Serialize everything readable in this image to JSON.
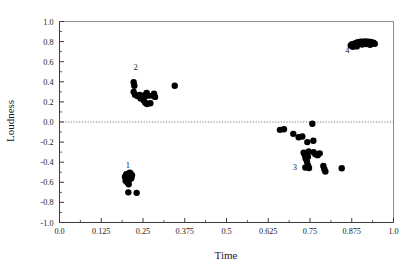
{
  "chart_data": {
    "type": "scatter",
    "title": "",
    "xlabel": "Time",
    "ylabel": "Loudness",
    "xlim": [
      0.0,
      1.0
    ],
    "ylim": [
      -1.0,
      1.0
    ],
    "grid": false,
    "legend": "none",
    "x_ticks": [
      0.0,
      0.125,
      0.25,
      0.375,
      0.5,
      0.625,
      0.75,
      0.875,
      1.0
    ],
    "x_tick_labels": [
      "0.0",
      "0.125",
      "0.25",
      "0.375",
      "0.5",
      "0.625",
      "0.75",
      "0.875",
      "1.0"
    ],
    "y_ticks": [
      -1.0,
      -0.8,
      -0.6,
      -0.4,
      -0.2,
      0.0,
      0.2,
      0.4,
      0.6,
      0.8,
      1.0
    ],
    "y_tick_labels": [
      "-1.0",
      "-0.8",
      "-0.6",
      "-0.4",
      "-0.2",
      "0.0",
      "0.2",
      "0.4",
      "0.6",
      "0.8",
      "1.0"
    ],
    "x_minor_ticks": [
      0.0625,
      0.1875,
      0.3125,
      0.4375,
      0.5625,
      0.6875,
      0.8125,
      0.9375
    ],
    "y_minor_ticks": [
      -0.9,
      -0.7,
      -0.5,
      -0.3,
      -0.1,
      0.1,
      0.3,
      0.5,
      0.7,
      0.9
    ],
    "reference_lines": [
      {
        "axis": "y",
        "value": 0.0,
        "style": "dotted"
      }
    ],
    "marker": {
      "shape": "circle",
      "color": "#000000",
      "size": 4.2
    },
    "annotations": [
      {
        "text": "1",
        "x": 0.205,
        "y": -0.455
      },
      {
        "text": "2",
        "x": 0.228,
        "y": 0.515
      },
      {
        "text": "3",
        "x": 0.705,
        "y": -0.475
      },
      {
        "text": "4",
        "x": 0.862,
        "y": 0.69
      }
    ],
    "series": [
      {
        "name": "1",
        "points": [
          {
            "x": 0.196,
            "y": -0.545
          },
          {
            "x": 0.2,
            "y": -0.52
          },
          {
            "x": 0.204,
            "y": -0.555
          },
          {
            "x": 0.207,
            "y": -0.53
          },
          {
            "x": 0.209,
            "y": -0.575
          },
          {
            "x": 0.211,
            "y": -0.545
          },
          {
            "x": 0.213,
            "y": -0.512
          },
          {
            "x": 0.215,
            "y": -0.56
          },
          {
            "x": 0.198,
            "y": -0.585
          },
          {
            "x": 0.203,
            "y": -0.6
          },
          {
            "x": 0.207,
            "y": -0.62
          },
          {
            "x": 0.21,
            "y": -0.505
          },
          {
            "x": 0.217,
            "y": -0.53
          },
          {
            "x": 0.201,
            "y": -0.565
          },
          {
            "x": 0.206,
            "y": -0.7
          },
          {
            "x": 0.231,
            "y": -0.705
          }
        ]
      },
      {
        "name": "2",
        "points": [
          {
            "x": 0.222,
            "y": 0.395
          },
          {
            "x": 0.224,
            "y": 0.36
          },
          {
            "x": 0.222,
            "y": 0.3
          },
          {
            "x": 0.226,
            "y": 0.272
          },
          {
            "x": 0.233,
            "y": 0.258
          },
          {
            "x": 0.24,
            "y": 0.27
          },
          {
            "x": 0.247,
            "y": 0.255
          },
          {
            "x": 0.252,
            "y": 0.24
          },
          {
            "x": 0.256,
            "y": 0.268
          },
          {
            "x": 0.261,
            "y": 0.29
          },
          {
            "x": 0.266,
            "y": 0.262
          },
          {
            "x": 0.252,
            "y": 0.215
          },
          {
            "x": 0.257,
            "y": 0.192
          },
          {
            "x": 0.262,
            "y": 0.178
          },
          {
            "x": 0.272,
            "y": 0.186
          },
          {
            "x": 0.28,
            "y": 0.262
          },
          {
            "x": 0.283,
            "y": 0.282
          },
          {
            "x": 0.286,
            "y": 0.25
          },
          {
            "x": 0.243,
            "y": 0.235
          },
          {
            "x": 0.345,
            "y": 0.36
          }
        ]
      },
      {
        "name": "3",
        "points": [
          {
            "x": 0.66,
            "y": -0.078
          },
          {
            "x": 0.672,
            "y": -0.072
          },
          {
            "x": 0.7,
            "y": -0.118
          },
          {
            "x": 0.716,
            "y": -0.152
          },
          {
            "x": 0.727,
            "y": -0.145
          },
          {
            "x": 0.742,
            "y": -0.2
          },
          {
            "x": 0.757,
            "y": -0.018
          },
          {
            "x": 0.76,
            "y": -0.186
          },
          {
            "x": 0.731,
            "y": -0.305
          },
          {
            "x": 0.735,
            "y": -0.33
          },
          {
            "x": 0.739,
            "y": -0.318
          },
          {
            "x": 0.744,
            "y": -0.345
          },
          {
            "x": 0.737,
            "y": -0.362
          },
          {
            "x": 0.746,
            "y": -0.292
          },
          {
            "x": 0.761,
            "y": -0.3
          },
          {
            "x": 0.766,
            "y": -0.322
          },
          {
            "x": 0.773,
            "y": -0.33
          },
          {
            "x": 0.779,
            "y": -0.312
          },
          {
            "x": 0.741,
            "y": -0.395
          },
          {
            "x": 0.744,
            "y": -0.432
          },
          {
            "x": 0.747,
            "y": -0.458
          },
          {
            "x": 0.736,
            "y": -0.452
          },
          {
            "x": 0.79,
            "y": -0.438
          },
          {
            "x": 0.793,
            "y": -0.47
          },
          {
            "x": 0.796,
            "y": -0.492
          },
          {
            "x": 0.845,
            "y": -0.46
          }
        ]
      },
      {
        "name": "4",
        "points": [
          {
            "x": 0.872,
            "y": 0.762
          },
          {
            "x": 0.876,
            "y": 0.775
          },
          {
            "x": 0.88,
            "y": 0.758
          },
          {
            "x": 0.883,
            "y": 0.78
          },
          {
            "x": 0.886,
            "y": 0.768
          },
          {
            "x": 0.889,
            "y": 0.79
          },
          {
            "x": 0.892,
            "y": 0.772
          },
          {
            "x": 0.895,
            "y": 0.795
          },
          {
            "x": 0.898,
            "y": 0.782
          },
          {
            "x": 0.901,
            "y": 0.8
          },
          {
            "x": 0.904,
            "y": 0.786
          },
          {
            "x": 0.908,
            "y": 0.798
          },
          {
            "x": 0.912,
            "y": 0.788
          },
          {
            "x": 0.916,
            "y": 0.802
          },
          {
            "x": 0.92,
            "y": 0.79
          },
          {
            "x": 0.924,
            "y": 0.8
          },
          {
            "x": 0.928,
            "y": 0.785
          },
          {
            "x": 0.932,
            "y": 0.796
          },
          {
            "x": 0.936,
            "y": 0.78
          },
          {
            "x": 0.94,
            "y": 0.788
          },
          {
            "x": 0.944,
            "y": 0.778
          },
          {
            "x": 0.878,
            "y": 0.748
          },
          {
            "x": 0.89,
            "y": 0.752
          },
          {
            "x": 0.906,
            "y": 0.77
          },
          {
            "x": 0.918,
            "y": 0.775
          },
          {
            "x": 0.93,
            "y": 0.768
          }
        ]
      }
    ]
  }
}
